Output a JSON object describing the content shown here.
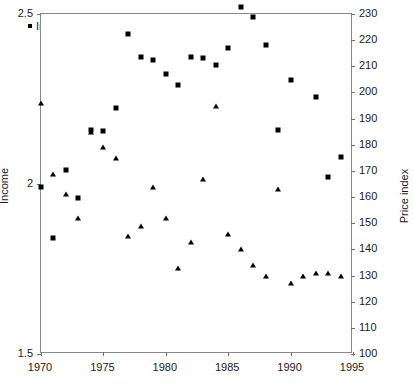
{
  "chart_data": {
    "type": "scatter",
    "title": "",
    "subtitle": "",
    "xlabel": "",
    "ylabel": "Income",
    "y2label": "Price index",
    "xlim": [
      1970,
      1995
    ],
    "ylim": [
      1.5,
      2.5
    ],
    "y2lim": [
      100,
      230
    ],
    "x_ticks": [
      1970,
      1975,
      1980,
      1985,
      1990,
      1995
    ],
    "y_ticks": [
      1.5,
      2,
      2.5
    ],
    "y2_ticks": [
      100,
      110,
      120,
      130,
      140,
      150,
      160,
      170,
      180,
      190,
      200,
      210,
      220,
      230
    ],
    "grid": false,
    "legend_position": "top-left",
    "x": [
      1970,
      1971,
      1972,
      1973,
      1974,
      1975,
      1976,
      1977,
      1978,
      1979,
      1980,
      1981,
      1982,
      1983,
      1984,
      1985,
      1986,
      1987,
      1988,
      1989,
      1990,
      1991,
      1992,
      1993,
      1994
    ],
    "series": [
      {
        "name": "Income",
        "marker": "square",
        "axis": "left",
        "color": "#000000",
        "values": [
          1.99,
          1.84,
          2.04,
          1.96,
          2.16,
          2.155,
          2.225,
          2.44,
          2.375,
          2.365,
          2.325,
          2.29,
          2.375,
          2.37,
          2.35,
          2.4,
          2.52,
          2.49,
          2.41,
          2.16,
          2.305,
          2.61,
          2.255,
          2.02,
          2.08
        ]
      },
      {
        "name": "Price index",
        "marker": "triangle",
        "axis": "right",
        "color": "#000000",
        "values": [
          196,
          169,
          161,
          152,
          185,
          179,
          175,
          145,
          149,
          164,
          152,
          133,
          143,
          167,
          195,
          146,
          140,
          134,
          130,
          163,
          127,
          130,
          131,
          131,
          130
        ]
      }
    ]
  },
  "legend": {
    "items": [
      {
        "label": "Income",
        "marker": "square-marker-icon"
      },
      {
        "label": "Price index",
        "marker": "triangle-marker-icon"
      }
    ]
  },
  "axes": {
    "left_title": "Income",
    "right_title": "Price index",
    "left_tick_labels": [
      "1.5",
      "2",
      "2.5"
    ],
    "right_tick_labels": [
      "100",
      "110",
      "120",
      "130",
      "140",
      "150",
      "160",
      "170",
      "180",
      "190",
      "200",
      "210",
      "220",
      "230"
    ],
    "x_tick_labels": [
      "1970",
      "1975",
      "1980",
      "1985",
      "1990",
      "1995"
    ]
  }
}
